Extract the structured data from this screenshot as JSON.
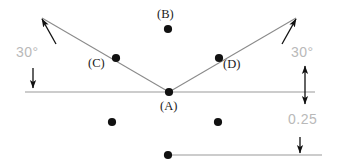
{
  "figure": {
    "type": "technical-drawing",
    "background_color": "#ffffff",
    "line_color": "#9a9a9a",
    "ray_color": "#8a8a8a",
    "dot_color": "#111111",
    "label_color": "#1a1a1a",
    "dimension_text_color": "#b9b9b9",
    "width": 338,
    "height": 166
  },
  "point_labels": [
    {
      "id": "A",
      "text": "(A)",
      "x": 160,
      "y": 100,
      "dot_x": 169,
      "dot_y": 92
    },
    {
      "id": "B",
      "text": "(B)",
      "x": 157,
      "y": 8,
      "dot_x": 168,
      "dot_y": 29
    },
    {
      "id": "C",
      "text": "(C)",
      "x": 88,
      "y": 57,
      "dot_x": 116,
      "dot_y": 58
    },
    {
      "id": "D",
      "text": "(D)",
      "x": 223,
      "y": 58,
      "dot_x": 219,
      "dot_y": 58
    }
  ],
  "extra_dots": [
    {
      "x": 112,
      "y": 122
    },
    {
      "x": 218,
      "y": 122
    },
    {
      "x": 168,
      "y": 155
    }
  ],
  "dimensions": [
    {
      "id": "angle-left",
      "text": "30°",
      "x": 16,
      "y": 45,
      "value": 30,
      "unit": "degrees"
    },
    {
      "id": "angle-right",
      "text": "30°",
      "x": 291,
      "y": 45,
      "value": 30,
      "unit": "degrees"
    },
    {
      "id": "offset",
      "text": "0.25",
      "x": 288,
      "y": 112,
      "value": 0.25,
      "unit": ""
    }
  ],
  "geometry": {
    "vertex": {
      "x": 169,
      "y": 92
    },
    "horizontal_line": {
      "x1": 25,
      "y1": 92,
      "x2": 315,
      "y2": 92
    },
    "bottom_line": {
      "x1": 168,
      "y1": 155,
      "x2": 322,
      "y2": 155
    },
    "ray_left": {
      "x1": 169,
      "y1": 92,
      "x2": 42,
      "y2": 18
    },
    "ray_right": {
      "x1": 169,
      "y1": 92,
      "x2": 296,
      "y2": 18
    },
    "angle_between_rays_and_horizontal": 30
  }
}
